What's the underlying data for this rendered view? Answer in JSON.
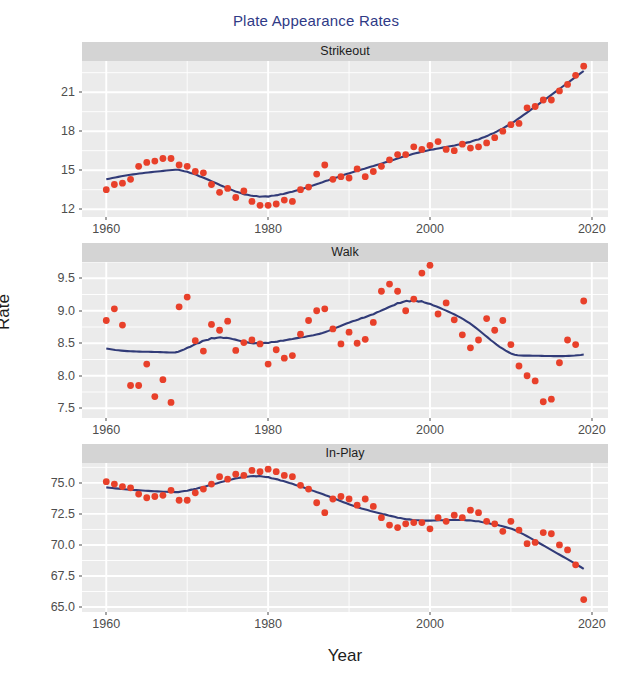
{
  "chart": {
    "title": "Plate Appearance Rates",
    "title_color": "#2f3a86",
    "x_axis_label": "Year",
    "y_axis_label": "Rate",
    "point_color": "#e8402a",
    "line_color": "#313b78",
    "panel_background": "#ebebeb",
    "strip_background": "#d4d4d4",
    "grid_color": "#ffffff"
  },
  "chart_data": {
    "type": "scatter",
    "title": "Plate Appearance Rates",
    "xlabel": "Year",
    "ylabel": "Rate",
    "grid": true,
    "legend": "none",
    "facets": [
      {
        "name": "Strikeout",
        "ylim": [
          11.4,
          23.4
        ],
        "yticks": [
          12,
          15,
          18,
          21
        ],
        "ytick_labels": [
          "12",
          "15",
          "18",
          "21"
        ],
        "xlim": [
          1957,
          2022
        ],
        "xticks": [
          1960,
          1980,
          2000,
          2020
        ],
        "xtick_labels": [
          "1960",
          "1980",
          "2000",
          "2020"
        ],
        "x": [
          1960,
          1961,
          1962,
          1963,
          1964,
          1965,
          1966,
          1967,
          1968,
          1969,
          1970,
          1971,
          1972,
          1973,
          1974,
          1975,
          1976,
          1977,
          1978,
          1979,
          1980,
          1981,
          1982,
          1983,
          1984,
          1985,
          1986,
          1987,
          1988,
          1989,
          1990,
          1991,
          1992,
          1993,
          1994,
          1995,
          1996,
          1997,
          1998,
          1999,
          2000,
          2001,
          2002,
          2003,
          2004,
          2005,
          2006,
          2007,
          2008,
          2009,
          2010,
          2011,
          2012,
          2013,
          2014,
          2015,
          2016,
          2017,
          2018,
          2019
        ],
        "y": [
          13.5,
          13.9,
          14.0,
          14.3,
          15.3,
          15.6,
          15.7,
          15.9,
          15.9,
          15.4,
          15.3,
          14.9,
          14.8,
          13.9,
          13.3,
          13.6,
          12.9,
          13.4,
          12.6,
          12.3,
          12.3,
          12.4,
          12.7,
          12.6,
          13.5,
          13.7,
          14.7,
          15.4,
          14.3,
          14.5,
          14.4,
          15.1,
          14.5,
          14.9,
          15.3,
          15.8,
          16.2,
          16.2,
          16.8,
          16.6,
          16.9,
          17.2,
          16.6,
          16.5,
          17.0,
          16.7,
          16.8,
          17.1,
          17.5,
          18.0,
          18.5,
          18.6,
          19.8,
          19.9,
          20.4,
          20.4,
          21.1,
          21.6,
          22.3,
          23.0
        ],
        "smoother": "loess"
      },
      {
        "name": "Walk",
        "ylim": [
          7.35,
          9.75
        ],
        "yticks": [
          7.5,
          8.0,
          8.5,
          9.0,
          9.5
        ],
        "ytick_labels": [
          "7.5",
          "8.0",
          "8.5",
          "9.0",
          "9.5"
        ],
        "xlim": [
          1957,
          2022
        ],
        "xticks": [
          1960,
          1980,
          2000,
          2020
        ],
        "xtick_labels": [
          "1960",
          "1980",
          "2000",
          "2020"
        ],
        "x": [
          1960,
          1961,
          1962,
          1963,
          1964,
          1965,
          1966,
          1967,
          1968,
          1969,
          1970,
          1971,
          1972,
          1973,
          1974,
          1975,
          1976,
          1977,
          1978,
          1979,
          1980,
          1981,
          1982,
          1983,
          1984,
          1985,
          1986,
          1987,
          1988,
          1989,
          1990,
          1991,
          1992,
          1993,
          1994,
          1995,
          1996,
          1997,
          1998,
          1999,
          2000,
          2001,
          2002,
          2003,
          2004,
          2005,
          2006,
          2007,
          2008,
          2009,
          2010,
          2011,
          2012,
          2013,
          2014,
          2015,
          2016,
          2017,
          2018,
          2019
        ],
        "y": [
          8.85,
          9.03,
          8.78,
          7.85,
          7.85,
          8.18,
          7.68,
          7.94,
          7.59,
          9.06,
          9.21,
          8.54,
          8.38,
          8.79,
          8.7,
          8.84,
          8.39,
          8.51,
          8.55,
          8.49,
          8.18,
          8.4,
          8.27,
          8.31,
          8.64,
          8.85,
          9.0,
          9.03,
          8.72,
          8.49,
          8.67,
          8.5,
          8.56,
          8.82,
          9.3,
          9.41,
          9.3,
          9.0,
          9.18,
          9.58,
          9.7,
          8.95,
          9.12,
          8.86,
          8.63,
          8.43,
          8.55,
          8.88,
          8.7,
          8.85,
          8.48,
          8.15,
          8.0,
          7.92,
          7.6,
          7.64,
          8.2,
          8.55,
          8.48,
          9.15
        ],
        "smoother": "loess"
      },
      {
        "name": "In-Play",
        "ylim": [
          64.6,
          76.6
        ],
        "yticks": [
          65.0,
          67.5,
          70.0,
          72.5,
          75.0
        ],
        "ytick_labels": [
          "65.0",
          "67.5",
          "70.0",
          "72.5",
          "75.0"
        ],
        "xlim": [
          1957,
          2022
        ],
        "xticks": [
          1960,
          1980,
          2000,
          2020
        ],
        "xtick_labels": [
          "1960",
          "1980",
          "2000",
          "2020"
        ],
        "x": [
          1960,
          1961,
          1962,
          1963,
          1964,
          1965,
          1966,
          1967,
          1968,
          1969,
          1970,
          1971,
          1972,
          1973,
          1974,
          1975,
          1976,
          1977,
          1978,
          1979,
          1980,
          1981,
          1982,
          1983,
          1984,
          1985,
          1986,
          1987,
          1988,
          1989,
          1990,
          1991,
          1992,
          1993,
          1994,
          1995,
          1996,
          1997,
          1998,
          1999,
          2000,
          2001,
          2002,
          2003,
          2004,
          2005,
          2006,
          2007,
          2008,
          2009,
          2010,
          2011,
          2012,
          2013,
          2014,
          2015,
          2016,
          2017,
          2018,
          2019
        ],
        "y": [
          75.1,
          74.9,
          74.7,
          74.6,
          74.1,
          73.8,
          73.9,
          74.0,
          74.4,
          73.6,
          73.6,
          74.2,
          74.5,
          74.9,
          75.5,
          75.3,
          75.7,
          75.6,
          76.0,
          75.9,
          76.1,
          75.9,
          75.6,
          75.5,
          74.8,
          74.5,
          73.4,
          72.6,
          73.7,
          73.9,
          73.7,
          73.2,
          73.7,
          73.1,
          72.2,
          71.6,
          71.4,
          71.7,
          71.8,
          71.8,
          71.3,
          72.2,
          71.9,
          72.4,
          72.2,
          72.8,
          72.6,
          71.9,
          71.7,
          71.1,
          71.9,
          71.2,
          70.1,
          70.2,
          71.0,
          70.9,
          70.0,
          69.6,
          68.4,
          65.6
        ],
        "smoother": "loess"
      }
    ]
  }
}
